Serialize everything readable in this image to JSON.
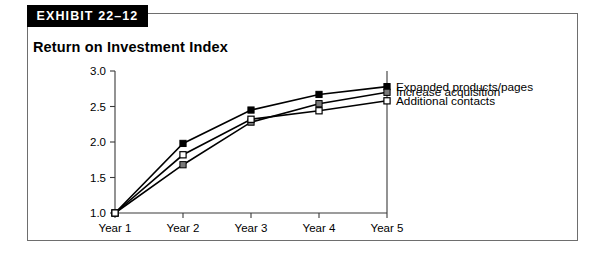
{
  "exhibit": {
    "tab_label": "EXHIBIT 22–12",
    "title": "Return on Investment Index"
  },
  "chart_data": {
    "type": "line",
    "title": "Return on Investment Index",
    "xlabel": "",
    "ylabel": "",
    "categories": [
      "Year 1",
      "Year 2",
      "Year 3",
      "Year 4",
      "Year 5"
    ],
    "ylim": [
      1.0,
      3.0
    ],
    "yticks": [
      "1.0",
      "1.5",
      "2.0",
      "2.5",
      "3.0"
    ],
    "ytick_values": [
      1.0,
      1.5,
      2.0,
      2.5,
      3.0
    ],
    "grid": false,
    "legend_position": "right-of-plot-at-endpoints",
    "series": [
      {
        "name": "Expanded products/pages",
        "marker": "filled-square",
        "color": "#000000",
        "values": [
          1.0,
          1.98,
          2.45,
          2.67,
          2.78
        ]
      },
      {
        "name": "Increase acquisition",
        "marker": "gray-square",
        "color": "#7a7a7a",
        "values": [
          1.0,
          1.68,
          2.28,
          2.54,
          2.7
        ]
      },
      {
        "name": "Additional contacts",
        "marker": "open-square",
        "color": "#ffffff",
        "values": [
          1.0,
          1.82,
          2.32,
          2.44,
          2.58
        ]
      }
    ]
  },
  "colors": {
    "border": "#6e6e6e",
    "axis": "#3a3a3a",
    "tab_background": "#000000",
    "tab_text": "#ffffff",
    "line": "#000000",
    "marker_filled": "#000000",
    "marker_gray": "#7a7a7a",
    "marker_open": "#ffffff"
  }
}
